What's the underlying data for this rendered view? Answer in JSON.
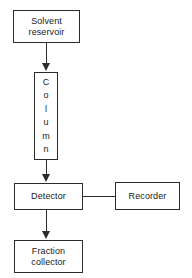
{
  "diagram": {
    "type": "flowchart",
    "background_color": "#ffffff",
    "line_color": "#2b2b2b",
    "text_color": "#1a1a1a",
    "nodes": [
      {
        "id": "solvent-reservoir",
        "label": "Solvent\nreservoir",
        "shape": "rectangle"
      },
      {
        "id": "column",
        "label": "Column",
        "shape": "rectangle",
        "orientation": "vertical-stacked-letters",
        "letters": [
          "C",
          "o",
          "l",
          "u",
          "m",
          "n"
        ]
      },
      {
        "id": "detector",
        "label": "Detector",
        "shape": "rectangle"
      },
      {
        "id": "recorder",
        "label": "Recorder",
        "shape": "rectangle"
      },
      {
        "id": "fraction-collector",
        "label": "Fraction\ncollector",
        "shape": "rectangle"
      }
    ],
    "edges": [
      {
        "id": "reservoir-to-column",
        "from": "solvent-reservoir",
        "to": "column",
        "direction": "down",
        "arrowhead": true
      },
      {
        "id": "column-to-detector",
        "from": "column",
        "to": "detector",
        "direction": "down",
        "arrowhead": true
      },
      {
        "id": "detector-to-recorder",
        "from": "detector",
        "to": "recorder",
        "direction": "right",
        "arrowhead": false
      },
      {
        "id": "detector-to-fraction-collector",
        "from": "detector",
        "to": "fraction-collector",
        "direction": "down",
        "arrowhead": true
      }
    ]
  }
}
